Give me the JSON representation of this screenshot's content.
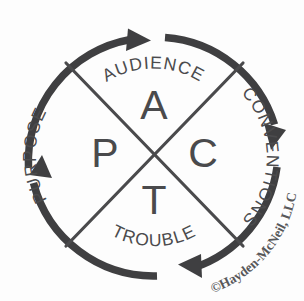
{
  "diagram": {
    "name": "PACT rhetorical situation wheel",
    "center_acronym": "PACT",
    "colors": {
      "stroke": "#3f3f41",
      "divider": "#4a4a4c",
      "text": "#4b4b4d",
      "background": "#fdfdfd",
      "copyright_text": "#58585a"
    },
    "flow_direction": "clockwise",
    "center_letters": [
      {
        "letter": "A",
        "position": "top",
        "quadrant": "audience"
      },
      {
        "letter": "C",
        "position": "right",
        "quadrant": "conventions"
      },
      {
        "letter": "T",
        "position": "bottom",
        "quadrant": "trouble"
      },
      {
        "letter": "P",
        "position": "left",
        "quadrant": "purpose"
      }
    ],
    "segments": [
      {
        "label": "AUDIENCE",
        "position": "top",
        "arrow": "right"
      },
      {
        "label": "CONVENTIONS",
        "position": "right",
        "arrow": "down"
      },
      {
        "label": "TROUBLE",
        "position": "bottom",
        "arrow": "left"
      },
      {
        "label": "PURPOSE",
        "position": "left",
        "arrow": "up"
      }
    ],
    "copyright": "©Hayden-McNeil, LLC"
  }
}
